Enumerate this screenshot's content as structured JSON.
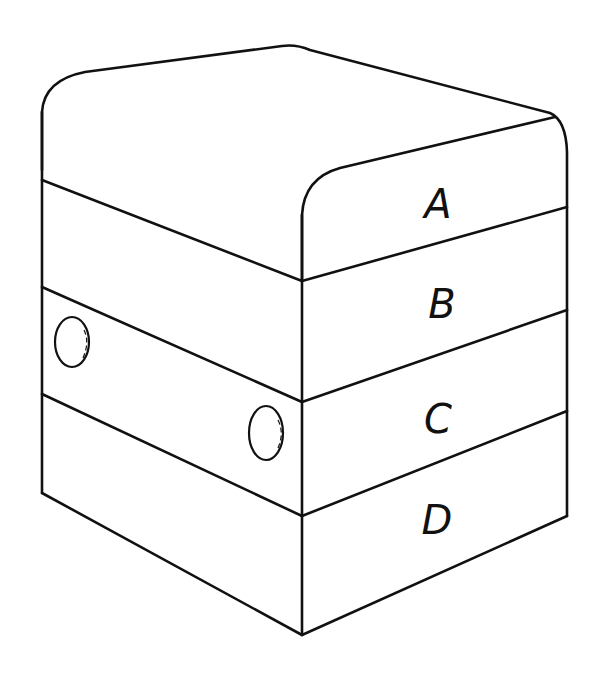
{
  "diagram": {
    "type": "stacked box / layered block illustration",
    "colors": {
      "stroke": "#111111",
      "background": "#ffffff"
    },
    "layers": [
      {
        "label": "A",
        "position": "top (rounded cap)"
      },
      {
        "label": "B",
        "position": "second"
      },
      {
        "label": "C",
        "position": "third (with two round pins on left face)"
      },
      {
        "label": "D",
        "position": "bottom"
      }
    ],
    "features": {
      "pins": [
        {
          "name": "pin-left",
          "layer": "C"
        },
        {
          "name": "pin-right",
          "layer": "C"
        }
      ]
    }
  }
}
